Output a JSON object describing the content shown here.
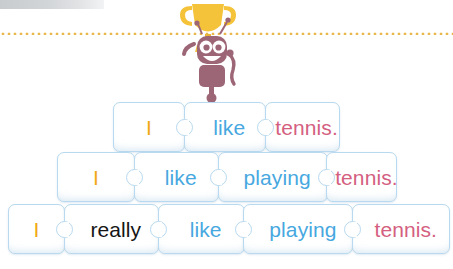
{
  "page": {
    "background_color": "#ffffff"
  },
  "top_bar": {
    "name": "decorative-grey-bar",
    "color": "#c9ccce"
  },
  "divider": {
    "name": "dotted-rule",
    "style": "dotted",
    "color": "#e8b84b"
  },
  "mascot": {
    "name": "robot-with-trophy",
    "robot_color": "#9d6677",
    "trophy_color": "#f5c339",
    "description": "Purple robot holding a gold trophy"
  },
  "colors": {
    "orange": "#f0a818",
    "blue": "#47a8e0",
    "pink": "#d4607f",
    "black": "#161616",
    "piece_border": "#b8d9ef",
    "piece_fill": "#ffffff"
  },
  "rows": [
    {
      "id": "row-1",
      "pieces": [
        {
          "text": "I",
          "color_key": "orange",
          "width": 72,
          "notch": false
        },
        {
          "text": "like",
          "color_key": "blue",
          "width": 82,
          "notch": true
        },
        {
          "text": "tennis.",
          "color_key": "pink",
          "width": 75,
          "notch": true
        }
      ]
    },
    {
      "id": "row-2",
      "pieces": [
        {
          "text": "I",
          "color_key": "orange",
          "width": 78,
          "notch": false
        },
        {
          "text": "like",
          "color_key": "blue",
          "width": 85,
          "notch": true
        },
        {
          "text": "playing",
          "color_key": "blue",
          "width": 110,
          "notch": true
        },
        {
          "text": "tennis.",
          "color_key": "pink",
          "width": 71,
          "notch": true
        }
      ]
    },
    {
      "id": "row-3",
      "pieces": [
        {
          "text": "I",
          "color_key": "orange",
          "width": 57,
          "notch": false
        },
        {
          "text": "really",
          "color_key": "black",
          "width": 95,
          "notch": true
        },
        {
          "text": "like",
          "color_key": "blue",
          "width": 87,
          "notch": true
        },
        {
          "text": "playing",
          "color_key": "blue",
          "width": 110,
          "notch": true
        },
        {
          "text": "tennis.",
          "color_key": "pink",
          "width": 98,
          "notch": true
        }
      ]
    }
  ]
}
